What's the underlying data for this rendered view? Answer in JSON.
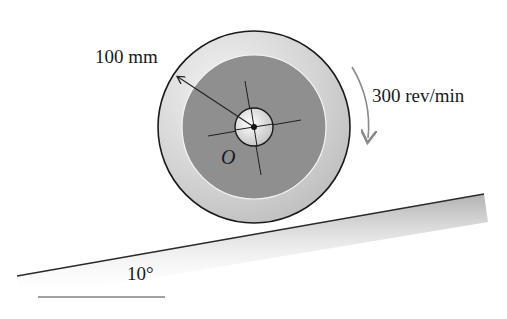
{
  "figure": {
    "type": "engineering mechanics diagram"
  },
  "labels": {
    "radius": "100 mm",
    "angular_speed": "300 rev/min",
    "center_point": "O",
    "incline_angle": "10°"
  },
  "geometry": {
    "wheel_center": [
      254,
      127
    ],
    "outer_radius_px": 96,
    "inner_disk_radius_px": 72,
    "hub_radius_px": 19,
    "incline_start": [
      17,
      276
    ],
    "incline_end": [
      484,
      194
    ],
    "angle_reference_line": [
      [
        38,
        297
      ],
      [
        165,
        297
      ]
    ],
    "rotation_direction": "clockwise"
  },
  "colors": {
    "background": "#ffffff",
    "outer_ring": "#d9d9d9",
    "inner_disk": "#8f8f8f",
    "hub": "#e8e8e8",
    "outline": "#1a1a1a",
    "rotation_arrow": "#8a8a8a",
    "ground_shading": "#b5b5b5"
  }
}
